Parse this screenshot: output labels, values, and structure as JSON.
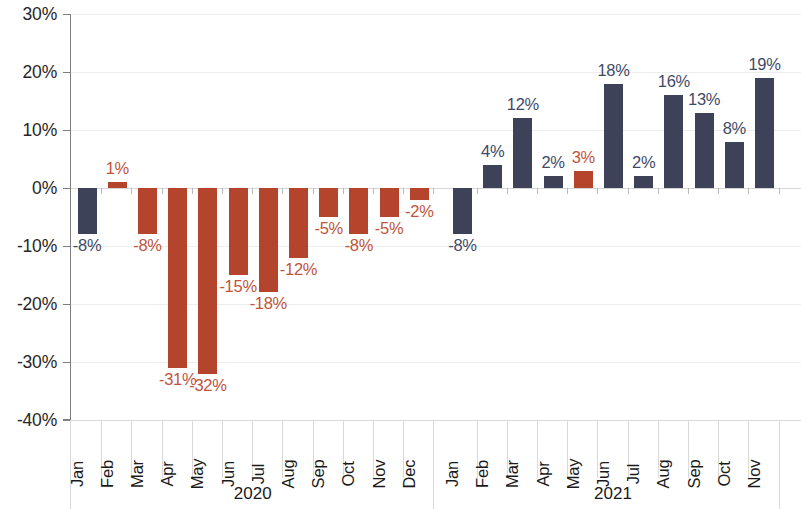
{
  "chart_data": {
    "type": "bar",
    "title": "",
    "subtitle": "",
    "xlabel": "",
    "ylabel": "",
    "ylim": [
      -40,
      30
    ],
    "yticks": [
      30,
      20,
      10,
      0,
      -10,
      -20,
      -30,
      -40
    ],
    "ytick_labels": [
      "30%",
      "20%",
      "10%",
      "0%",
      "-10%",
      "-20%",
      "-30%",
      "-40%"
    ],
    "grid": true,
    "legend": "none",
    "value_format": "percent",
    "colors": {
      "navy": "#3e4259",
      "red": "#b4442b",
      "navy_label": "#3e4a66",
      "red_label": "#c0543a",
      "gridline": "#ededed",
      "axis": "#7d7d7d",
      "background": "#ffffff"
    },
    "groups": [
      {
        "year": "2020",
        "categories": [
          "Jan",
          "Feb",
          "Mar",
          "Apr",
          "May",
          "Jun",
          "Jul",
          "Aug",
          "Sep",
          "Oct",
          "Nov",
          "Dec"
        ],
        "values": [
          -8,
          1,
          -8,
          -31,
          -32,
          -15,
          -18,
          -12,
          -5,
          -8,
          -5,
          -2
        ],
        "labels": [
          "-8%",
          "1%",
          "-8%",
          "-31%",
          "-32%",
          "-15%",
          "-18%",
          "-12%",
          "-5%",
          "-8%",
          "-5%",
          "-2%"
        ],
        "series_colors": [
          "navy",
          "red",
          "red",
          "red",
          "red",
          "red",
          "red",
          "red",
          "red",
          "red",
          "red",
          "red"
        ]
      },
      {
        "year": "2021",
        "categories": [
          "Jan",
          "Feb",
          "Mar",
          "Apr",
          "May",
          "Jun",
          "Jul",
          "Aug",
          "Sep",
          "Oct",
          "Nov"
        ],
        "values": [
          -8,
          4,
          12,
          2,
          3,
          18,
          2,
          16,
          13,
          8,
          19
        ],
        "labels": [
          "-8%",
          "4%",
          "12%",
          "2%",
          "3%",
          "18%",
          "2%",
          "16%",
          "13%",
          "8%",
          "19%"
        ],
        "series_colors": [
          "navy",
          "navy",
          "navy",
          "navy",
          "red",
          "navy",
          "navy",
          "navy",
          "navy",
          "navy",
          "navy"
        ]
      }
    ]
  }
}
